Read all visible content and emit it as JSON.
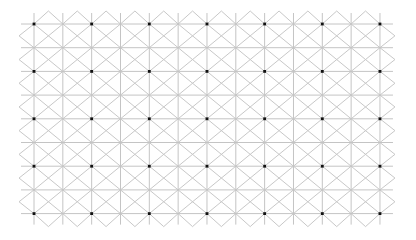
{
  "figure": {
    "type": "extinction-illusion-grid",
    "background": "#ffffff",
    "line_color": "#c4c4c4",
    "dot_color": "#111111",
    "grid": {
      "origin_x": 34,
      "origin_y": 24,
      "spacing_x": 28.83,
      "spacing_y": 23.7,
      "columns": 13,
      "rows": 9,
      "cap_x": 15,
      "cap_y": 13
    },
    "dots": {
      "every_nth_column": 2,
      "every_nth_row": 2,
      "radius": 1.4,
      "count_x": 7,
      "count_y": 5
    }
  }
}
